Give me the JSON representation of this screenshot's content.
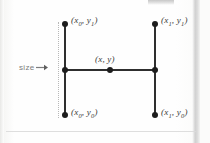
{
  "figure": {
    "kind": "geometry-diagram",
    "annotation": {
      "size_label": "size",
      "arrow_icon": "arrow-right-icon"
    },
    "points": [
      {
        "id": "top-left",
        "label": "(x",
        "sub1": "0",
        "mid": ", y",
        "sub2": "1",
        "close": ")",
        "x": 65,
        "y": 24
      },
      {
        "id": "top-right",
        "label": "(x",
        "sub1": "1",
        "mid": ", y",
        "sub2": "1",
        "close": ")",
        "x": 155,
        "y": 24
      },
      {
        "id": "center",
        "label": "(x",
        "sub1": "",
        "mid": ", y",
        "sub2": "",
        "close": ")",
        "x": 110,
        "y": 70
      },
      {
        "id": "bottom-left",
        "label": "(x",
        "sub1": "0",
        "mid": ", y",
        "sub2": "0",
        "close": ")",
        "x": 65,
        "y": 115
      },
      {
        "id": "bottom-right",
        "label": "(x",
        "sub1": "1",
        "mid": ", y",
        "sub2": "0",
        "close": ")",
        "x": 155,
        "y": 115
      }
    ],
    "labels": {
      "top_left_x": "x",
      "top_left_x_sub": "0",
      "top_left_y": "y",
      "top_left_y_sub": "1",
      "top_right_x": "x",
      "top_right_x_sub": "1",
      "top_right_y": "y",
      "top_right_y_sub": "1",
      "center_x": "x",
      "center_y": "y",
      "bottom_left_x": "x",
      "bottom_left_x_sub": "0",
      "bottom_left_y": "y",
      "bottom_left_y_sub": "0",
      "bottom_right_x": "x",
      "bottom_right_x_sub": "1",
      "bottom_right_y": "y",
      "bottom_right_y_sub": "0",
      "open_paren": "(",
      "comma": ", ",
      "close_paren": ")"
    },
    "colors": {
      "stroke": "#2e2e2e",
      "node": "#1d1d1d",
      "label_text": "#3a3a3a",
      "annotation_text": "#7c7c7c",
      "guide": "#b8b8b8",
      "background": "#fdfdfc"
    }
  }
}
